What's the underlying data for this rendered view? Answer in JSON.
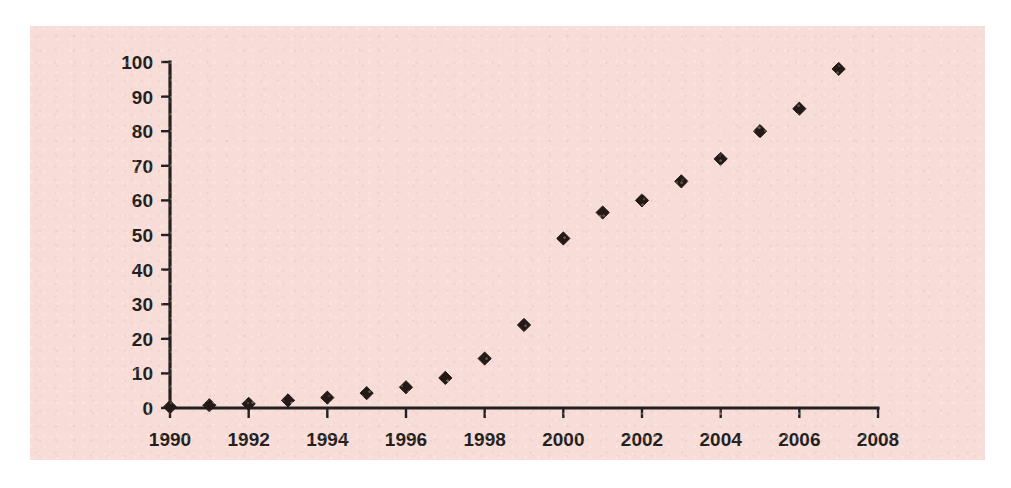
{
  "panel": {
    "background_color": "#f8dcd8",
    "page_background_color": "#ffffff"
  },
  "chart_data": {
    "type": "scatter",
    "title": "",
    "subtitle": "",
    "xlabel": "",
    "ylabel": "",
    "marker": "diamond",
    "marker_color": "#231a16",
    "grid": false,
    "legend": false,
    "xlim": [
      1990,
      2008
    ],
    "ylim": [
      0,
      100
    ],
    "x_tick_step": 2,
    "y_tick_step": 10,
    "x_ticks": [
      "1990",
      "1992",
      "1994",
      "1996",
      "1998",
      "2000",
      "2002",
      "2004",
      "2006",
      "2008"
    ],
    "y_ticks": [
      "0",
      "10",
      "20",
      "30",
      "40",
      "50",
      "60",
      "70",
      "80",
      "90",
      "100"
    ],
    "x": [
      1990,
      1991,
      1992,
      1993,
      1994,
      1995,
      1996,
      1997,
      1998,
      1999,
      2000,
      2001,
      2002,
      2003,
      2004,
      2005,
      2006,
      2007
    ],
    "values": [
      0.3,
      0.8,
      1.2,
      2.2,
      3.0,
      4.3,
      6.0,
      8.7,
      14.3,
      24.0,
      49.0,
      56.5,
      60.0,
      65.5,
      72.0,
      80.0,
      86.5,
      98.0
    ],
    "points": [
      {
        "x": 1990,
        "y": 0.3
      },
      {
        "x": 1991,
        "y": 0.8
      },
      {
        "x": 1992,
        "y": 1.2
      },
      {
        "x": 1993,
        "y": 2.2
      },
      {
        "x": 1994,
        "y": 3.0
      },
      {
        "x": 1995,
        "y": 4.3
      },
      {
        "x": 1996,
        "y": 6.0
      },
      {
        "x": 1997,
        "y": 8.7
      },
      {
        "x": 1998,
        "y": 14.3
      },
      {
        "x": 1999,
        "y": 24.0
      },
      {
        "x": 2000,
        "y": 49.0
      },
      {
        "x": 2001,
        "y": 56.5
      },
      {
        "x": 2002,
        "y": 60.0
      },
      {
        "x": 2003,
        "y": 65.5
      },
      {
        "x": 2004,
        "y": 72.0
      },
      {
        "x": 2005,
        "y": 80.0
      },
      {
        "x": 2006,
        "y": 86.5
      },
      {
        "x": 2007,
        "y": 98.0
      }
    ]
  }
}
